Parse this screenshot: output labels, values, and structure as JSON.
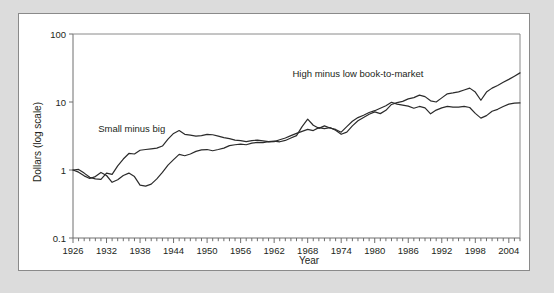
{
  "figure": {
    "background_color": "#dcdcdc",
    "panel_color": "#ffffff",
    "border_color": "#8a8a8a"
  },
  "chart_data": {
    "type": "line",
    "title": "",
    "xlabel": "Year",
    "ylabel": "Dollars (log scale)",
    "yscale": "log",
    "ylim": [
      0.1,
      100
    ],
    "xlim": [
      1926,
      2006
    ],
    "grid": false,
    "legend_position": "inline-annotations",
    "ytick_labels": [
      "100",
      "10",
      "1",
      "0.1"
    ],
    "ytick_values": [
      100,
      10,
      1,
      0.1
    ],
    "xtick_labels": [
      "1926",
      "1932",
      "1938",
      "1944",
      "1950",
      "1956",
      "1962",
      "1968",
      "1974",
      "1980",
      "1986",
      "1992",
      "1998",
      "2004"
    ],
    "xtick_values": [
      1926,
      1932,
      1938,
      1944,
      1950,
      1956,
      1962,
      1968,
      1974,
      1980,
      1986,
      1992,
      1998,
      2004
    ],
    "minor_xtick_step": 1,
    "annotations": [
      {
        "text": "Small minus big",
        "x": 1936.5,
        "y": 3.6
      },
      {
        "text": "High minus low book-to-market",
        "x": 1977.0,
        "y": 23.0
      }
    ],
    "x": [
      1926,
      1927,
      1928,
      1929,
      1930,
      1931,
      1932,
      1933,
      1934,
      1935,
      1936,
      1937,
      1938,
      1939,
      1940,
      1941,
      1942,
      1943,
      1944,
      1945,
      1946,
      1947,
      1948,
      1949,
      1950,
      1951,
      1952,
      1953,
      1954,
      1955,
      1956,
      1957,
      1958,
      1959,
      1960,
      1961,
      1962,
      1963,
      1964,
      1965,
      1966,
      1967,
      1968,
      1969,
      1970,
      1971,
      1972,
      1973,
      1974,
      1975,
      1976,
      1977,
      1978,
      1979,
      1980,
      1981,
      1982,
      1983,
      1984,
      1985,
      1986,
      1987,
      1988,
      1989,
      1990,
      1991,
      1992,
      1993,
      1994,
      1995,
      1996,
      1997,
      1998,
      1999,
      2000,
      2001,
      2002,
      2003,
      2004,
      2005,
      2006
    ],
    "series": [
      {
        "name": "Small minus big",
        "label": "Small minus big",
        "color": "#2b2b2b",
        "values": [
          1.0,
          1.02,
          0.9,
          0.78,
          0.74,
          0.73,
          0.9,
          0.86,
          1.15,
          1.45,
          1.75,
          1.72,
          1.95,
          2.0,
          2.05,
          2.1,
          2.25,
          2.85,
          3.45,
          3.8,
          3.35,
          3.25,
          3.15,
          3.2,
          3.35,
          3.3,
          3.15,
          3.0,
          2.9,
          2.75,
          2.7,
          2.62,
          2.7,
          2.75,
          2.68,
          2.62,
          2.65,
          2.6,
          2.72,
          2.95,
          3.2,
          4.35,
          5.6,
          4.55,
          4.1,
          4.45,
          4.15,
          3.95,
          3.6,
          4.35,
          5.2,
          5.9,
          6.4,
          7.0,
          7.45,
          8.1,
          8.8,
          9.9,
          9.3,
          9.0,
          8.7,
          8.1,
          8.6,
          8.2,
          6.7,
          7.6,
          8.2,
          8.6,
          8.4,
          8.4,
          8.6,
          8.3,
          6.8,
          5.8,
          6.3,
          7.3,
          7.8,
          8.6,
          9.3,
          9.6,
          9.7
        ]
      },
      {
        "name": "High minus low book-to-market",
        "label": "High minus low book-to-market",
        "color": "#2b2b2b",
        "values": [
          1.0,
          0.93,
          0.82,
          0.75,
          0.8,
          0.92,
          0.83,
          0.66,
          0.72,
          0.83,
          0.9,
          0.8,
          0.6,
          0.58,
          0.62,
          0.74,
          0.92,
          1.18,
          1.42,
          1.7,
          1.62,
          1.72,
          1.88,
          1.98,
          2.0,
          1.92,
          2.0,
          2.1,
          2.28,
          2.35,
          2.4,
          2.35,
          2.48,
          2.55,
          2.52,
          2.6,
          2.62,
          2.78,
          2.95,
          3.2,
          3.45,
          3.7,
          3.95,
          3.8,
          4.2,
          4.05,
          4.2,
          3.85,
          3.35,
          3.6,
          4.45,
          5.3,
          5.9,
          6.6,
          7.15,
          6.75,
          7.55,
          9.2,
          9.8,
          10.2,
          11.1,
          11.6,
          12.6,
          12.0,
          10.4,
          10.0,
          11.5,
          13.2,
          13.6,
          14.1,
          15.0,
          16.0,
          14.0,
          10.6,
          14.0,
          16.0,
          17.5,
          19.5,
          21.5,
          24.0,
          26.8
        ]
      }
    ]
  }
}
